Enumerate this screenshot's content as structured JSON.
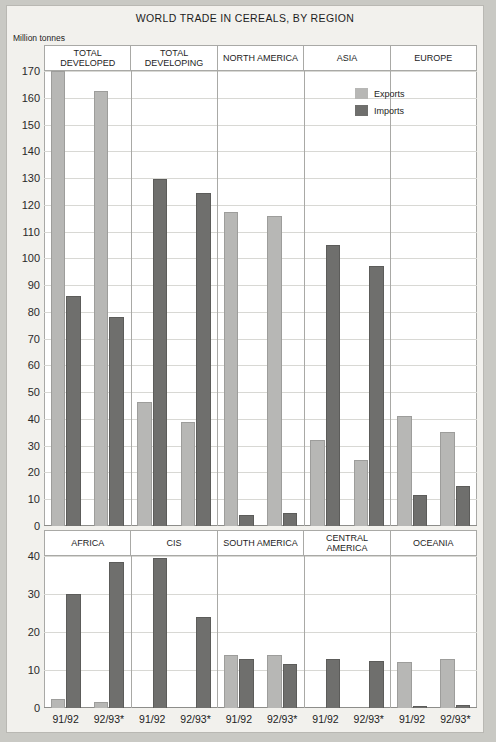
{
  "title": "WORLD TRADE IN CEREALS, BY REGION",
  "units": "Million tonnes",
  "legend": {
    "exports_label": "Exports",
    "imports_label": "Imports",
    "exports_color": "#b7b7b5",
    "imports_color": "#6f6f6d"
  },
  "periods": [
    "91/92",
    "92/93*"
  ],
  "chart_data": [
    {
      "type": "bar",
      "title": "WORLD TRADE IN CEREALS, BY REGION",
      "subtitle": "",
      "ylabel": "Million tonnes",
      "xlabel": "",
      "ylim": [
        0,
        170
      ],
      "yticks": [
        0,
        10,
        20,
        30,
        40,
        50,
        60,
        70,
        80,
        90,
        100,
        110,
        120,
        130,
        140,
        150,
        160,
        170
      ],
      "grid": true,
      "legend_position": "top-right",
      "panel": "upper",
      "categories": [
        "TOTAL DEVELOPED",
        "TOTAL DEVELOPING",
        "NORTH AMERICA",
        "ASIA",
        "EUROPE"
      ],
      "x": [
        "91/92",
        "92/93*"
      ],
      "series": [
        {
          "name": "Exports",
          "color": "#b7b7b5",
          "values_by_category": {
            "TOTAL DEVELOPED": [
              170.0,
              162.5
            ],
            "TOTAL DEVELOPING": [
              46.5,
              39.0
            ],
            "NORTH AMERICA": [
              117.5,
              116.0
            ],
            "ASIA": [
              32.0,
              24.5
            ],
            "EUROPE": [
              41.0,
              35.0
            ]
          }
        },
        {
          "name": "Imports",
          "color": "#6f6f6d",
          "values_by_category": {
            "TOTAL DEVELOPED": [
              86.0,
              78.0
            ],
            "TOTAL DEVELOPING": [
              129.5,
              124.5
            ],
            "NORTH AMERICA": [
              4.0,
              5.0
            ],
            "ASIA": [
              105.0,
              97.0
            ],
            "EUROPE": [
              11.5,
              15.0
            ]
          }
        }
      ]
    },
    {
      "type": "bar",
      "title": "",
      "ylabel": "Million tonnes",
      "xlabel": "",
      "ylim": [
        0,
        40
      ],
      "yticks": [
        0,
        10,
        20,
        30,
        40
      ],
      "grid": true,
      "legend_position": "none",
      "panel": "lower",
      "categories": [
        "AFRICA",
        "CIS",
        "SOUTH AMERICA",
        "CENTRAL AMERICA",
        "OCEANIA"
      ],
      "x": [
        "91/92",
        "92/93*"
      ],
      "series": [
        {
          "name": "Exports",
          "color": "#b7b7b5",
          "values_by_category": {
            "AFRICA": [
              2.5,
              1.5
            ],
            "CIS": [
              0.0,
              0.0
            ],
            "SOUTH AMERICA": [
              14.0,
              14.0
            ],
            "CENTRAL AMERICA": [
              0.0,
              0.0
            ],
            "OCEANIA": [
              12.0,
              13.0
            ]
          }
        },
        {
          "name": "Imports",
          "color": "#6f6f6d",
          "values_by_category": {
            "AFRICA": [
              30.0,
              38.5
            ],
            "CIS": [
              39.5,
              24.0
            ],
            "SOUTH AMERICA": [
              13.0,
              11.5
            ],
            "CENTRAL AMERICA": [
              13.0,
              12.5
            ],
            "OCEANIA": [
              0.5,
              0.8
            ]
          }
        }
      ]
    }
  ]
}
